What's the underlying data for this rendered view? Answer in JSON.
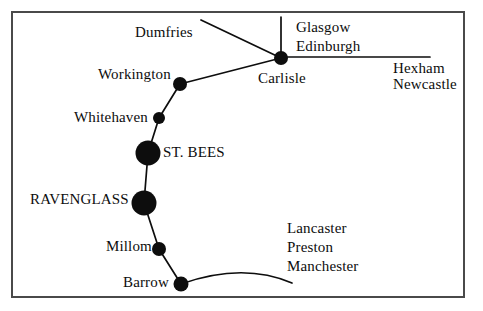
{
  "figure": {
    "type": "rail-network-schematic-map",
    "background_color": "#ffffff",
    "ink_color": "#0d0d0d",
    "border": {
      "name": "figure-border",
      "x": 11,
      "y": 11,
      "width": 454,
      "height": 287,
      "stroke_width": 2,
      "color": "#4a4a4a"
    }
  },
  "stations": [
    {
      "id": "carlisle",
      "label": "Carlisle",
      "cx": 281,
      "cy": 58,
      "r": 7,
      "emphasis": "normal"
    },
    {
      "id": "workington",
      "label": "Workington",
      "cx": 180,
      "cy": 84,
      "r": 7,
      "emphasis": "normal"
    },
    {
      "id": "whitehaven",
      "label": "Whitehaven",
      "cx": 159,
      "cy": 118,
      "r": 6,
      "emphasis": "normal"
    },
    {
      "id": "st-bees",
      "label": "ST. BEES",
      "cx": 148,
      "cy": 153,
      "r": 12,
      "emphasis": "major"
    },
    {
      "id": "ravenglass",
      "label": "RAVENGLASS",
      "cx": 144,
      "cy": 203,
      "r": 12,
      "emphasis": "major"
    },
    {
      "id": "millom",
      "label": "Millom",
      "cx": 159,
      "cy": 249,
      "r": 7,
      "emphasis": "normal"
    },
    {
      "id": "barrow",
      "label": "Barrow",
      "cx": 181,
      "cy": 284,
      "r": 7,
      "emphasis": "normal"
    }
  ],
  "offmap_destinations": [
    {
      "id": "dumfries",
      "label": "Dumfries"
    },
    {
      "id": "glasgow",
      "label": "Glasgow"
    },
    {
      "id": "edinburgh",
      "label": "Edinburgh"
    },
    {
      "id": "hexham",
      "label": "Hexham"
    },
    {
      "id": "newcastle",
      "label": "Newcastle"
    },
    {
      "id": "lancaster",
      "label": "Lancaster"
    },
    {
      "id": "preston",
      "label": "Preston"
    },
    {
      "id": "manchester",
      "label": "Manchester"
    }
  ],
  "lines": [
    {
      "id": "carlisle-to-dumfries",
      "from": "carlisle",
      "to": "dumfries",
      "path": "M 281 58 L 201 20"
    },
    {
      "id": "carlisle-to-glasgow-edinburgh",
      "from": "carlisle",
      "to": "glasgow-edinburgh",
      "path": "M 281 58 L 281 17"
    },
    {
      "id": "carlisle-to-hexham-newcastle",
      "from": "carlisle",
      "to": "hexham-newcastle",
      "path": "M 281 57 L 430 57"
    },
    {
      "id": "carlisle-to-workington",
      "from": "carlisle",
      "to": "workington",
      "path": "M 281 58 L 180 84"
    },
    {
      "id": "workington-to-whitehaven",
      "from": "workington",
      "to": "whitehaven",
      "path": "M 180 84 L 159 118"
    },
    {
      "id": "whitehaven-to-st-bees",
      "from": "whitehaven",
      "to": "st-bees",
      "path": "M 159 118 L 148 153"
    },
    {
      "id": "st-bees-to-ravenglass",
      "from": "st-bees",
      "to": "ravenglass",
      "path": "M 148 153 L 144 203"
    },
    {
      "id": "ravenglass-to-millom",
      "from": "ravenglass",
      "to": "millom",
      "path": "M 144 203 L 159 249"
    },
    {
      "id": "millom-to-barrow",
      "from": "millom",
      "to": "barrow",
      "path": "M 159 249 L 181 284"
    },
    {
      "id": "barrow-to-lancaster-preston-manchester",
      "from": "barrow",
      "to": "lancaster-preston-manchester",
      "path": "M 181 284 Q 243 262 292 283"
    }
  ]
}
